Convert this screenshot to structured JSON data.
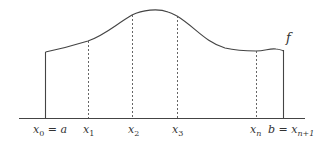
{
  "figure": {
    "function_label": "f",
    "colors": {
      "curve": "#444444",
      "axis": "#444444",
      "dashed": "#555555",
      "text": "#333333",
      "background": "#ffffff"
    },
    "axis": {
      "y": 118,
      "x_start": 19,
      "x_end": 305
    },
    "left_bound": {
      "x": 45,
      "top_y": 52
    },
    "right_bound": {
      "x": 283,
      "top_y": 50
    },
    "partition_points": [
      {
        "name": "x1",
        "x": 88,
        "curve_y": 41
      },
      {
        "name": "x2",
        "x": 132,
        "curve_y": 15
      },
      {
        "name": "x3",
        "x": 177,
        "curve_y": 16
      },
      {
        "name": "xn",
        "x": 256,
        "curve_y": 51
      }
    ],
    "labels": {
      "x0_main": "x",
      "x0_sub": "0",
      "x0_eq": " = a",
      "x1_main": "x",
      "x1_sub": "1",
      "x2_main": "x",
      "x2_sub": "2",
      "x3_main": "x",
      "x3_sub": "3",
      "xn_main": "x",
      "xn_sub": "n",
      "b_prefix": "b = x",
      "b_sub": "n+1",
      "f": "f"
    }
  }
}
